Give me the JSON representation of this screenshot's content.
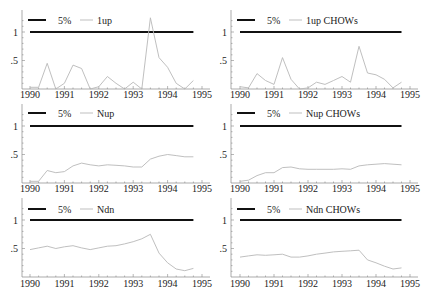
{
  "figure": {
    "x_tick_labels": [
      "1990",
      "1991",
      "1992",
      "1993",
      "1994",
      "1995"
    ],
    "y_tick_labels": [
      "1",
      ".5"
    ],
    "legend_reference_label": "5%"
  },
  "chart_data": [
    {
      "type": "line",
      "title": "",
      "legend": [
        "5%",
        "1up"
      ],
      "xlabel": "",
      "ylabel": "",
      "x_start": 1990.0,
      "x_step": 0.25,
      "xlim": [
        1990,
        1995
      ],
      "ylim": [
        0,
        1.3
      ],
      "xticks": [
        1990,
        1991,
        1992,
        1993,
        1994,
        1995
      ],
      "yticks": [
        0.5,
        1
      ],
      "grid": false,
      "legend_position": "top-left",
      "series": [
        {
          "name": "5%",
          "values": [
            1,
            1,
            1,
            1,
            1,
            1,
            1,
            1,
            1,
            1,
            1,
            1,
            1,
            1,
            1,
            1,
            1,
            1,
            1,
            1
          ]
        },
        {
          "name": "1up",
          "values": [
            0.03,
            0.03,
            0.45,
            0.0,
            0.1,
            0.42,
            0.36,
            0.0,
            0.04,
            0.22,
            0.1,
            0.0,
            0.12,
            0.0,
            1.25,
            0.55,
            0.38,
            0.1,
            0.0,
            0.15
          ]
        }
      ]
    },
    {
      "type": "line",
      "title": "",
      "legend": [
        "5%",
        "1up CHOWs"
      ],
      "xlabel": "",
      "ylabel": "",
      "x_start": 1990.0,
      "x_step": 0.25,
      "xlim": [
        1990,
        1995
      ],
      "ylim": [
        0,
        1.3
      ],
      "xticks": [
        1990,
        1991,
        1992,
        1993,
        1994,
        1995
      ],
      "yticks": [
        0.5,
        1
      ],
      "grid": false,
      "legend_position": "top-left",
      "series": [
        {
          "name": "5%",
          "values": [
            1,
            1,
            1,
            1,
            1,
            1,
            1,
            1,
            1,
            1,
            1,
            1,
            1,
            1,
            1,
            1,
            1,
            1,
            1,
            1
          ]
        },
        {
          "name": "1up CHOWs",
          "values": [
            0.04,
            0.02,
            0.27,
            0.15,
            0.08,
            0.55,
            0.17,
            0.0,
            0.02,
            0.12,
            0.08,
            0.15,
            0.22,
            0.12,
            0.75,
            0.28,
            0.25,
            0.17,
            0.02,
            0.12
          ]
        }
      ]
    },
    {
      "type": "line",
      "title": "",
      "legend": [
        "5%",
        "Nup"
      ],
      "xlabel": "",
      "ylabel": "",
      "x_start": 1990.0,
      "x_step": 0.25,
      "xlim": [
        1990,
        1995
      ],
      "ylim": [
        0,
        1.3
      ],
      "xticks": [
        1990,
        1991,
        1992,
        1993,
        1994,
        1995
      ],
      "yticks": [
        0.5,
        1
      ],
      "grid": false,
      "legend_position": "top-left",
      "series": [
        {
          "name": "5%",
          "values": [
            1,
            1,
            1,
            1,
            1,
            1,
            1,
            1,
            1,
            1,
            1,
            1,
            1,
            1,
            1,
            1,
            1,
            1,
            1,
            1
          ]
        },
        {
          "name": "Nup",
          "values": [
            0.03,
            0.03,
            0.22,
            0.18,
            0.2,
            0.3,
            0.35,
            0.32,
            0.3,
            0.32,
            0.31,
            0.3,
            0.28,
            0.28,
            0.42,
            0.47,
            0.5,
            0.48,
            0.46,
            0.46
          ]
        }
      ]
    },
    {
      "type": "line",
      "title": "",
      "legend": [
        "5%",
        "Nup CHOWs"
      ],
      "xlabel": "",
      "ylabel": "",
      "x_start": 1990.0,
      "x_step": 0.25,
      "xlim": [
        1990,
        1995
      ],
      "ylim": [
        0,
        1.3
      ],
      "xticks": [
        1990,
        1991,
        1992,
        1993,
        1994,
        1995
      ],
      "yticks": [
        0.5,
        1
      ],
      "grid": false,
      "legend_position": "top-left",
      "series": [
        {
          "name": "5%",
          "values": [
            1,
            1,
            1,
            1,
            1,
            1,
            1,
            1,
            1,
            1,
            1,
            1,
            1,
            1,
            1,
            1,
            1,
            1,
            1,
            1
          ]
        },
        {
          "name": "Nup CHOWs",
          "values": [
            0.03,
            0.05,
            0.13,
            0.18,
            0.18,
            0.27,
            0.28,
            0.25,
            0.24,
            0.24,
            0.24,
            0.24,
            0.25,
            0.24,
            0.3,
            0.32,
            0.33,
            0.34,
            0.33,
            0.32
          ]
        }
      ]
    },
    {
      "type": "line",
      "title": "",
      "legend": [
        "5%",
        "Ndn"
      ],
      "xlabel": "",
      "ylabel": "",
      "x_start": 1990.0,
      "x_step": 0.25,
      "xlim": [
        1990,
        1995
      ],
      "ylim": [
        0,
        1.3
      ],
      "xticks": [
        1990,
        1991,
        1992,
        1993,
        1994,
        1995
      ],
      "yticks": [
        0.5,
        1
      ],
      "grid": false,
      "legend_position": "top-left",
      "series": [
        {
          "name": "5%",
          "values": [
            1,
            1,
            1,
            1,
            1,
            1,
            1,
            1,
            1,
            1,
            1,
            1,
            1,
            1,
            1,
            1,
            1,
            1,
            1,
            1
          ]
        },
        {
          "name": "Ndn",
          "values": [
            0.48,
            0.51,
            0.54,
            0.5,
            0.53,
            0.55,
            0.51,
            0.48,
            0.51,
            0.54,
            0.55,
            0.58,
            0.62,
            0.67,
            0.75,
            0.42,
            0.25,
            0.14,
            0.11,
            0.15
          ]
        }
      ]
    },
    {
      "type": "line",
      "title": "",
      "legend": [
        "5%",
        "Ndn CHOWs"
      ],
      "xlabel": "",
      "ylabel": "",
      "x_start": 1990.0,
      "x_step": 0.25,
      "xlim": [
        1990,
        1995
      ],
      "ylim": [
        0,
        1.3
      ],
      "xticks": [
        1990,
        1991,
        1992,
        1993,
        1994,
        1995
      ],
      "yticks": [
        0.5,
        1
      ],
      "grid": false,
      "legend_position": "top-left",
      "series": [
        {
          "name": "5%",
          "values": [
            1,
            1,
            1,
            1,
            1,
            1,
            1,
            1,
            1,
            1,
            1,
            1,
            1,
            1,
            1,
            1,
            1,
            1,
            1,
            1
          ]
        },
        {
          "name": "Ndn CHOWs",
          "values": [
            0.35,
            0.37,
            0.39,
            0.38,
            0.39,
            0.4,
            0.35,
            0.35,
            0.37,
            0.4,
            0.42,
            0.44,
            0.45,
            0.46,
            0.47,
            0.3,
            0.25,
            0.19,
            0.14,
            0.16
          ]
        }
      ]
    }
  ],
  "style": {
    "reference_line_color": "#111111",
    "series_line_color": "#b8b8b8",
    "axis_color": "#888888"
  }
}
